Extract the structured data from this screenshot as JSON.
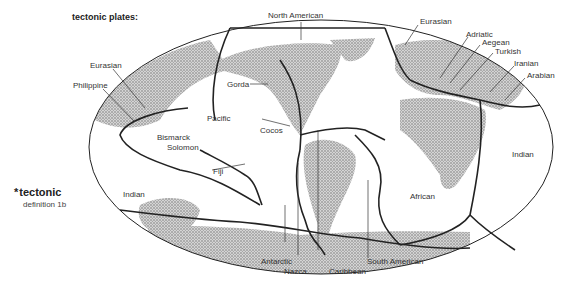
{
  "title": "tectonic plates:",
  "definition": {
    "star": "*",
    "word": "tectonic",
    "sub": "definition 1b"
  },
  "labels": {
    "north_american": "North American",
    "eurasian_east": "Eurasian",
    "eurasian_west": "Eurasian",
    "philippine": "Philippine",
    "adriatic": "Adriatic",
    "aegean": "Aegean",
    "turkish": "Turkish",
    "iranian": "Iranian",
    "arabian": "Arabian",
    "gorda": "Gorda",
    "pacific": "Pacific",
    "cocos": "Cocos",
    "bismarck": "Bismarck",
    "solomon": "Solomon",
    "fiji": "Fiji",
    "indian_west": "Indian",
    "indian_east": "Indian",
    "african": "African",
    "antarctic": "Antarctic",
    "nazca": "Nazca",
    "caribbean": "Caribbean",
    "south_american": "South American"
  },
  "colors": {
    "line": "#222222",
    "land": "#bdbdbd",
    "background": "#ffffff"
  }
}
